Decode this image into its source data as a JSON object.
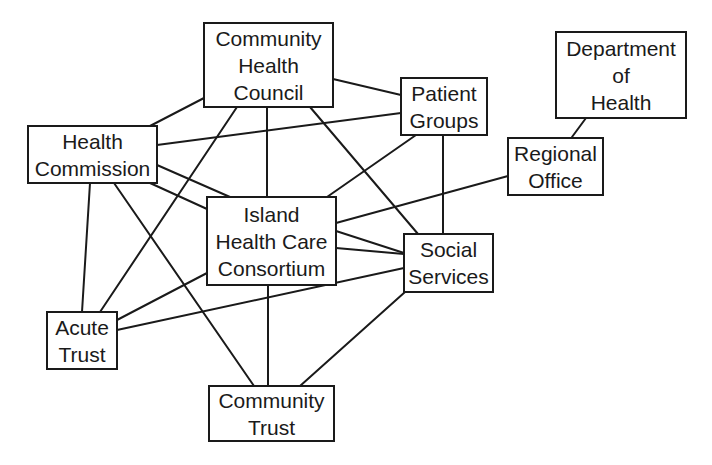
{
  "diagram": {
    "type": "network",
    "nodes": [
      {
        "id": "chc",
        "lines": [
          "Community",
          "Health",
          "Council"
        ]
      },
      {
        "id": "patient",
        "lines": [
          "Patient",
          "Groups"
        ]
      },
      {
        "id": "doh",
        "lines": [
          "Department",
          "of",
          "Health"
        ]
      },
      {
        "id": "regional",
        "lines": [
          "Regional",
          "Office"
        ]
      },
      {
        "id": "hcomm",
        "lines": [
          "Health",
          "Commission"
        ]
      },
      {
        "id": "island",
        "lines": [
          "Island",
          "Health Care",
          "Consortium"
        ]
      },
      {
        "id": "social",
        "lines": [
          "Social",
          "Services"
        ]
      },
      {
        "id": "acute",
        "lines": [
          "Acute",
          "Trust"
        ]
      },
      {
        "id": "ctrust",
        "lines": [
          "Community",
          "Trust"
        ]
      }
    ],
    "edges": [
      [
        "chc",
        "hcomm"
      ],
      [
        "chc",
        "patient"
      ],
      [
        "chc",
        "island"
      ],
      [
        "chc",
        "social"
      ],
      [
        "chc",
        "acute"
      ],
      [
        "hcomm",
        "patient"
      ],
      [
        "hcomm",
        "island"
      ],
      [
        "hcomm",
        "island"
      ],
      [
        "hcomm",
        "acute"
      ],
      [
        "hcomm",
        "ctrust"
      ],
      [
        "patient",
        "island"
      ],
      [
        "patient",
        "social"
      ],
      [
        "doh",
        "regional"
      ],
      [
        "regional",
        "island"
      ],
      [
        "island",
        "social"
      ],
      [
        "island",
        "social"
      ],
      [
        "island",
        "acute"
      ],
      [
        "island",
        "ctrust"
      ],
      [
        "social",
        "acute"
      ],
      [
        "social",
        "ctrust"
      ]
    ],
    "line_color": "#1a1a1a",
    "box_border_color": "#1a1a1a",
    "background": "#ffffff"
  }
}
